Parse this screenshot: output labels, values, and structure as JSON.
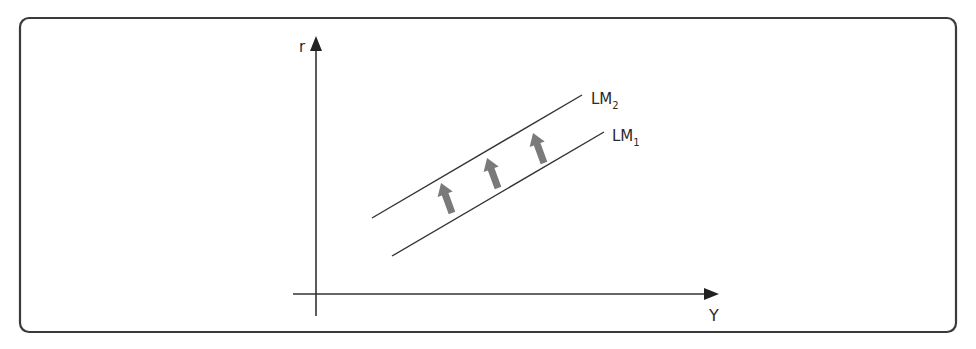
{
  "diagram": {
    "type": "economics-graph",
    "axes": {
      "y_label": "r",
      "x_label": "Y"
    },
    "curves": [
      {
        "name": "LM2",
        "label_main": "LM",
        "label_sub": "2"
      },
      {
        "name": "LM1",
        "label_main": "LM",
        "label_sub": "1"
      }
    ],
    "shift_arrows": {
      "count": 3,
      "direction": "up-left",
      "color": "#7a7a7a"
    },
    "colors": {
      "frame": "#3a3a3a",
      "lines": "#333333",
      "arrows": "#7a7a7a"
    }
  }
}
